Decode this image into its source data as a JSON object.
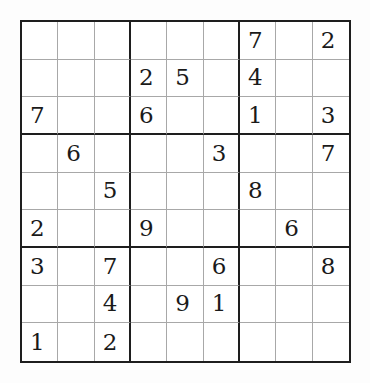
{
  "puzzle": {
    "type": "sudoku",
    "size": 9,
    "grid": [
      [
        "",
        "",
        "",
        "",
        "",
        "",
        "7",
        "",
        "2"
      ],
      [
        "",
        "",
        "",
        "2",
        "5",
        "",
        "4",
        "",
        ""
      ],
      [
        "7",
        "",
        "",
        "6",
        "",
        "",
        "1",
        "",
        "3"
      ],
      [
        "",
        "6",
        "",
        "",
        "",
        "3",
        "",
        "",
        "7"
      ],
      [
        "",
        "",
        "5",
        "",
        "",
        "",
        "8",
        "",
        ""
      ],
      [
        "2",
        "",
        "",
        "9",
        "",
        "",
        "",
        "6",
        ""
      ],
      [
        "3",
        "",
        "7",
        "",
        "",
        "6",
        "",
        "",
        "8"
      ],
      [
        "",
        "",
        "4",
        "",
        "9",
        "1",
        "",
        "",
        ""
      ],
      [
        "1",
        "",
        "2",
        "",
        "",
        "",
        "",
        "",
        ""
      ]
    ]
  },
  "colors": {
    "thick_line": "#1e1e1e",
    "thin_line": "#a8a8a8",
    "digit": "#1a1a1a",
    "background": "#ffffff"
  }
}
